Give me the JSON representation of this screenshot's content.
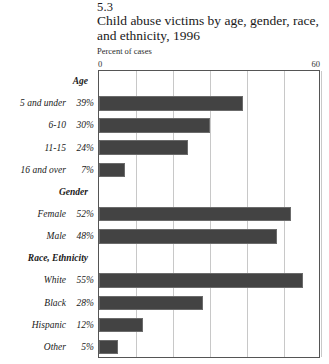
{
  "figure": {
    "number": "5.3",
    "title": "Child abuse victims by age, gender, race, and ethnicity, 1996",
    "subtitle": "Percent of cases"
  },
  "axis": {
    "min_label": "0",
    "max_label": "60"
  },
  "sections": [
    {
      "heading": "Age"
    },
    {
      "heading": "Gender"
    },
    {
      "heading": "Race, Ethnicity"
    }
  ],
  "rows": [
    {
      "kind": "section",
      "label": "Age",
      "value": "",
      "number": null
    },
    {
      "kind": "data",
      "label": "5 and under",
      "value": "39%",
      "number": 39
    },
    {
      "kind": "data",
      "label": "6-10",
      "value": "30%",
      "number": 30
    },
    {
      "kind": "data",
      "label": "11-15",
      "value": "24%",
      "number": 24
    },
    {
      "kind": "data",
      "label": "16 and over",
      "value": "7%",
      "number": 7
    },
    {
      "kind": "section",
      "label": "Gender",
      "value": "",
      "number": null
    },
    {
      "kind": "data",
      "label": "Female",
      "value": "52%",
      "number": 52
    },
    {
      "kind": "data",
      "label": "Male",
      "value": "48%",
      "number": 48
    },
    {
      "kind": "section",
      "label": "Race, Ethnicity",
      "value": "",
      "number": null
    },
    {
      "kind": "data",
      "label": "White",
      "value": "55%",
      "number": 55
    },
    {
      "kind": "data",
      "label": "Black",
      "value": "28%",
      "number": 28
    },
    {
      "kind": "data",
      "label": "Hispanic",
      "value": "12%",
      "number": 12
    },
    {
      "kind": "data",
      "label": "Other",
      "value": "5%",
      "number": 5
    }
  ],
  "colors": {
    "bar_fill": "#434343",
    "bar_border": "#6b6b6b",
    "gridline": "#c8c8c8",
    "frame": "#555555",
    "text": "#1a1a1a"
  },
  "chart_data": {
    "type": "bar",
    "orientation": "horizontal",
    "title": "Child abuse victims by age, gender, race, and ethnicity, 1996",
    "subtitle": "Percent of cases",
    "figure_number": "5.3",
    "xlabel": "Percent of cases",
    "ylabel": "",
    "xlim": [
      0,
      60
    ],
    "xticks": [
      0,
      10,
      20,
      30,
      40,
      50,
      60
    ],
    "xtick_labels_shown": [
      "0",
      "60"
    ],
    "grid": "vertical",
    "legend": "none",
    "groups": [
      {
        "name": "Age",
        "categories": [
          "5 and under",
          "6-10",
          "11-15",
          "16 and over"
        ],
        "values": [
          39,
          30,
          24,
          7
        ]
      },
      {
        "name": "Gender",
        "categories": [
          "Female",
          "Male"
        ],
        "values": [
          52,
          48
        ]
      },
      {
        "name": "Race, Ethnicity",
        "categories": [
          "White",
          "Black",
          "Hispanic",
          "Other"
        ],
        "values": [
          55,
          28,
          12,
          5
        ]
      }
    ],
    "categories": [
      "5 and under",
      "6-10",
      "11-15",
      "16 and over",
      "Female",
      "Male",
      "White",
      "Black",
      "Hispanic",
      "Other"
    ],
    "values": [
      39,
      30,
      24,
      7,
      52,
      48,
      55,
      28,
      12,
      5
    ],
    "value_labels": [
      "39%",
      "30%",
      "24%",
      "7%",
      "52%",
      "48%",
      "55%",
      "28%",
      "12%",
      "5%"
    ]
  }
}
